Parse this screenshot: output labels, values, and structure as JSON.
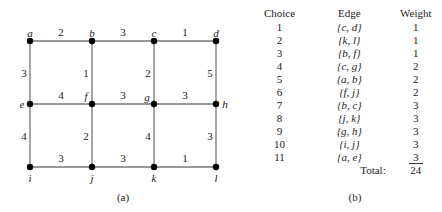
{
  "graph": {
    "caption": "(a)",
    "nodes": [
      {
        "id": "a",
        "x": 30,
        "y": 41,
        "lx": 30,
        "ly": 33
      },
      {
        "id": "b",
        "x": 92,
        "y": 41,
        "lx": 92,
        "ly": 33
      },
      {
        "id": "c",
        "x": 154,
        "y": 41,
        "lx": 154,
        "ly": 33
      },
      {
        "id": "d",
        "x": 216,
        "y": 41,
        "lx": 216,
        "ly": 33
      },
      {
        "id": "e",
        "x": 30,
        "y": 104,
        "lx": 22,
        "ly": 104
      },
      {
        "id": "f",
        "x": 92,
        "y": 104,
        "lx": 86,
        "ly": 96
      },
      {
        "id": "g",
        "x": 154,
        "y": 104,
        "lx": 147,
        "ly": 97
      },
      {
        "id": "h",
        "x": 216,
        "y": 104,
        "lx": 225,
        "ly": 104
      },
      {
        "id": "i",
        "x": 30,
        "y": 167,
        "lx": 30,
        "ly": 178
      },
      {
        "id": "j",
        "x": 92,
        "y": 167,
        "lx": 92,
        "ly": 178
      },
      {
        "id": "k",
        "x": 154,
        "y": 167,
        "lx": 154,
        "ly": 178
      },
      {
        "id": "l",
        "x": 216,
        "y": 167,
        "lx": 216,
        "ly": 178
      }
    ],
    "edges": [
      {
        "u": "a",
        "v": "b",
        "w": "2"
      },
      {
        "u": "b",
        "v": "c",
        "w": "3"
      },
      {
        "u": "c",
        "v": "d",
        "w": "1"
      },
      {
        "u": "a",
        "v": "e",
        "w": "3"
      },
      {
        "u": "b",
        "v": "f",
        "w": "1"
      },
      {
        "u": "c",
        "v": "g",
        "w": "2"
      },
      {
        "u": "d",
        "v": "h",
        "w": "5"
      },
      {
        "u": "e",
        "v": "f",
        "w": "4"
      },
      {
        "u": "f",
        "v": "g",
        "w": "3"
      },
      {
        "u": "g",
        "v": "h",
        "w": "3"
      },
      {
        "u": "e",
        "v": "i",
        "w": "4"
      },
      {
        "u": "f",
        "v": "j",
        "w": "2"
      },
      {
        "u": "g",
        "v": "k",
        "w": "4"
      },
      {
        "u": "h",
        "v": "l",
        "w": "3"
      },
      {
        "u": "i",
        "v": "j",
        "w": "3"
      },
      {
        "u": "j",
        "v": "k",
        "w": "3"
      },
      {
        "u": "k",
        "v": "l",
        "w": "1"
      }
    ]
  },
  "table": {
    "caption": "(b)",
    "headers": [
      "Choice",
      "Edge",
      "Weight"
    ],
    "rows": [
      [
        "1",
        "{c, d}",
        "1"
      ],
      [
        "2",
        "{k, l}",
        "1"
      ],
      [
        "3",
        "{b, f}",
        "1"
      ],
      [
        "4",
        "{c, g}",
        "2"
      ],
      [
        "5",
        "{a, b}",
        "2"
      ],
      [
        "6",
        "{f, j}",
        "2"
      ],
      [
        "7",
        "{b, c}",
        "3"
      ],
      [
        "8",
        "{j, k}",
        "3"
      ],
      [
        "9",
        "{g, h}",
        "3"
      ],
      [
        "10",
        "{i, j}",
        "3"
      ],
      [
        "11",
        "{a, e}",
        "3"
      ]
    ],
    "total_label": "Total:",
    "total_value": "24"
  }
}
